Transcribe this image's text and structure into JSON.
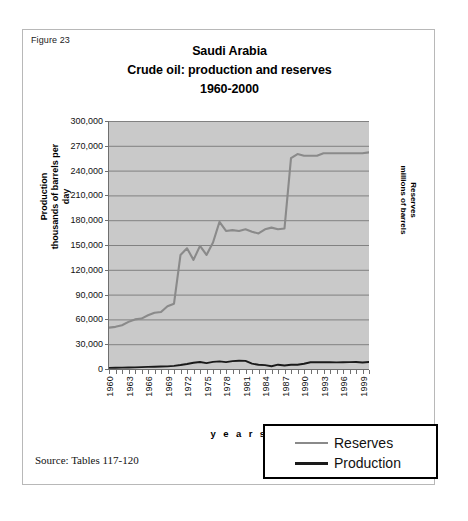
{
  "figure": {
    "label": "Figure 23",
    "source_note": "Source: Tables 117-120"
  },
  "chart_data": {
    "type": "line",
    "title": "Saudi Arabia\nCrude oil: production and reserves\n1960-2000",
    "title_lines": [
      "Saudi Arabia",
      "Crude oil: production and reserves",
      "1960-2000"
    ],
    "xlabel": "y e a r s",
    "ylabel": "Production\nthousands of barrels per day",
    "ylabel_lines": [
      "Production",
      "thousands of barrels per day"
    ],
    "y2label": "Reserves\nmillions of barrels",
    "y2label_lines": [
      "Reserves",
      "millions of barrels"
    ],
    "ylim": [
      0,
      300000
    ],
    "ytick_step": 30000,
    "ytick_labels": [
      "300,000",
      "270,000",
      "240,000",
      "210,000",
      "180,000",
      "150,000",
      "120,000",
      "90,000",
      "60,000",
      "30,000",
      "0"
    ],
    "ytick_values": [
      300000,
      270000,
      240000,
      210000,
      180000,
      150000,
      120000,
      90000,
      60000,
      30000,
      0
    ],
    "xlim": [
      1960,
      2000
    ],
    "xtick_labels": [
      "1960",
      "1963",
      "1966",
      "1969",
      "1972",
      "1975",
      "1978",
      "1981",
      "1984",
      "1987",
      "1990",
      "1993",
      "1996",
      "1999"
    ],
    "xtick_values": [
      1960,
      1963,
      1966,
      1969,
      1972,
      1975,
      1978,
      1981,
      1984,
      1987,
      1990,
      1993,
      1996,
      1999
    ],
    "grid": true,
    "plot_background": "#c9c9c9",
    "legend_position": "below-right",
    "legend": [
      "Reserves",
      "Production"
    ],
    "x": [
      1960,
      1961,
      1962,
      1963,
      1964,
      1965,
      1966,
      1967,
      1968,
      1969,
      1970,
      1971,
      1972,
      1973,
      1974,
      1975,
      1976,
      1977,
      1978,
      1979,
      1980,
      1981,
      1982,
      1983,
      1984,
      1985,
      1986,
      1987,
      1988,
      1989,
      1990,
      1991,
      1992,
      1993,
      1994,
      1995,
      1996,
      1997,
      1998,
      1999,
      2000
    ],
    "series": [
      {
        "name": "Reserves",
        "color": "#8a8a8a",
        "axis": "right",
        "units": "millions of barrels",
        "values": [
          50000,
          51000,
          53000,
          57000,
          60000,
          61000,
          65000,
          68000,
          69000,
          76000,
          79000,
          138000,
          146000,
          132000,
          149000,
          138000,
          153000,
          178000,
          167000,
          168000,
          167000,
          169000,
          166000,
          164000,
          169000,
          171000,
          169000,
          170000,
          255000,
          260000,
          258000,
          258000,
          258000,
          261000,
          261000,
          261000,
          261000,
          261000,
          261000,
          261000,
          262000
        ]
      },
      {
        "name": "Production",
        "color": "#1a1a1a",
        "axis": "left",
        "units": "thousands of barrels per day",
        "values": [
          1314,
          1480,
          1641,
          1792,
          1997,
          2219,
          2602,
          2810,
          3044,
          3216,
          3799,
          4769,
          6016,
          7596,
          8480,
          7075,
          8577,
          9200,
          8301,
          9532,
          9900,
          9815,
          6483,
          5086,
          4663,
          3388,
          5208,
          4265,
          5086,
          5064,
          6410,
          8115,
          8332,
          8198,
          8120,
          8023,
          8218,
          8362,
          8389,
          7833,
          8404
        ]
      }
    ]
  }
}
